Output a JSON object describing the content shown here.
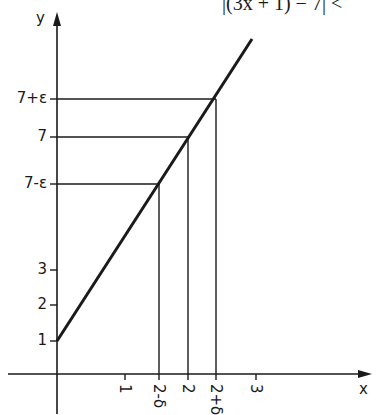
{
  "figure": {
    "title_text": "|(3x + 1) − 7| <",
    "axis_labels": {
      "x": "x",
      "y": "y"
    },
    "y_ticks": [
      {
        "label": "1",
        "y_px": 341
      },
      {
        "label": "2",
        "y_px": 305
      },
      {
        "label": "3",
        "y_px": 270
      },
      {
        "label": "7-ε",
        "y_px": 184
      },
      {
        "label": "7",
        "y_px": 137
      },
      {
        "label": "7+ε",
        "y_px": 99
      }
    ],
    "x_ticks": [
      {
        "label": "1",
        "x_px": 125
      },
      {
        "label": "2-δ",
        "x_px": 159
      },
      {
        "label": "2",
        "x_px": 188
      },
      {
        "label": "2+δ",
        "x_px": 216
      },
      {
        "label": "3",
        "x_px": 256
      }
    ],
    "line": {
      "equation": "y = 3x + 1",
      "start": [
        57,
        341
      ],
      "end": [
        252,
        39
      ]
    },
    "guides": [
      {
        "name": "7-eps",
        "x_px": 159,
        "y_px": 184
      },
      {
        "name": "7",
        "x_px": 188,
        "y_px": 137
      },
      {
        "name": "7+eps",
        "x_px": 216,
        "y_px": 99
      }
    ],
    "color": "#1a1a1a"
  }
}
